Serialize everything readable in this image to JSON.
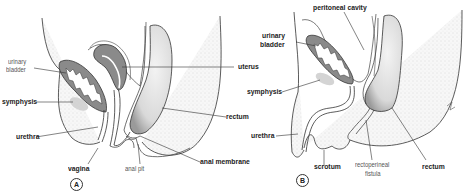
{
  "panels": [
    {
      "id": "A",
      "badge": "A",
      "labels": {
        "urinary_bladder_1": "urinary",
        "urinary_bladder_2": "bladder",
        "symphysis": "symphysis",
        "urethra": "urethra",
        "vagina": "vagina",
        "anal_pit": "anal pit",
        "anal_membrane": "anal membrane",
        "rectum": "rectum",
        "uterus": "uterus"
      }
    },
    {
      "id": "B",
      "badge": "B",
      "labels": {
        "peritoneal_cavity": "peritoneal cavity",
        "urinary_bladder_1": "urinary",
        "urinary_bladder_2": "bladder",
        "symphysis": "symphysis",
        "urethra": "urethra",
        "scrotum": "scrotum",
        "rectoperineal_fistula_1": "rectoperineal",
        "rectoperineal_fistula_2": "fistula",
        "rectum": "rectum"
      }
    }
  ],
  "colors": {
    "organ_fill": "#8a8a8a",
    "outline": "#333333",
    "stipple": "#e6e6e6",
    "symphysis": "#c8c8c8"
  }
}
